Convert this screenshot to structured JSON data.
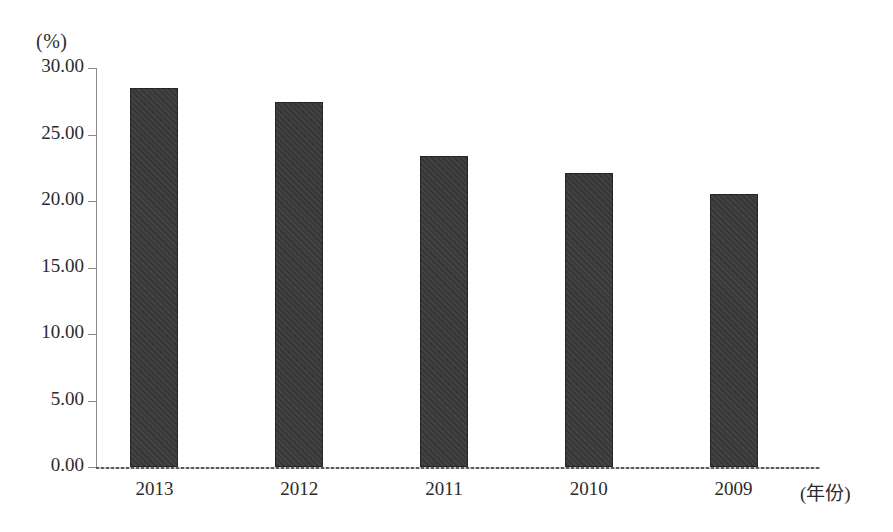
{
  "chart_data": {
    "type": "bar",
    "title": "",
    "subtitle": "",
    "categories": [
      "2013",
      "2012",
      "2011",
      "2010",
      "2009"
    ],
    "values": [
      28.5,
      27.45,
      23.35,
      22.1,
      20.5
    ],
    "series": [
      {
        "name": "",
        "values": [
          28.5,
          27.45,
          23.35,
          22.1,
          20.5
        ]
      }
    ],
    "xlabel": "(年份)",
    "ylabel": "(%)",
    "ylim": [
      0,
      30
    ],
    "xlim_note": "categorical",
    "y_ticks": [
      "30.00",
      "25.00",
      "20.00",
      "15.00",
      "10.00",
      "5.00",
      "0.00"
    ],
    "y_tick_values": [
      30,
      25,
      20,
      15,
      10,
      5,
      0
    ],
    "y_tick_step": 5,
    "grid": false,
    "legend": "none",
    "annotations": [],
    "bar_color": "#3a3a3a",
    "axis_color": "#8c8c8c",
    "text_color": "#2b2b2b",
    "background_color": "#ffffff"
  },
  "axes": {
    "y_unit_label": "(%)",
    "x_axis_title": "(年份)"
  }
}
